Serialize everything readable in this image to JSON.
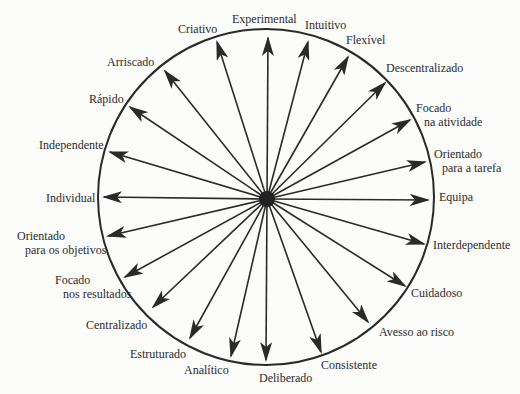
{
  "diagram": {
    "center": {
      "x": 267,
      "y": 199
    },
    "circle": {
      "cx": 266,
      "cy": 197,
      "r": 168
    },
    "colors": {
      "line": "#2a2a2a",
      "background": "#fcfcfa"
    },
    "spokes": [
      {
        "id": "experimental",
        "lines": [
          "Experimental"
        ],
        "tip": [
          268,
          38
        ],
        "label_pos": [
          232,
          12
        ]
      },
      {
        "id": "intuitivo",
        "lines": [
          "Intuitivo"
        ],
        "tip": [
          308,
          42
        ],
        "label_pos": [
          305,
          18
        ]
      },
      {
        "id": "flexivel",
        "lines": [
          "Flexível"
        ],
        "tip": [
          348,
          57
        ],
        "label_pos": [
          346,
          33
        ]
      },
      {
        "id": "descentralizado",
        "lines": [
          "Descentralizado"
        ],
        "tip": [
          385,
          83
        ],
        "label_pos": [
          386,
          61
        ]
      },
      {
        "id": "focado-na-atividade",
        "lines": [
          "Focado",
          "na atividade"
        ],
        "tip": [
          410,
          120
        ],
        "label_pos": [
          416,
          101
        ]
      },
      {
        "id": "orientado-para-a-tarefa",
        "lines": [
          "Orientado",
          "para a tarefa"
        ],
        "tip": [
          425,
          162
        ],
        "label_pos": [
          434,
          147
        ]
      },
      {
        "id": "equipa",
        "lines": [
          "Equipa"
        ],
        "tip": [
          428,
          200
        ],
        "label_pos": [
          439,
          190
        ]
      },
      {
        "id": "interdependente",
        "lines": [
          "Interdependente"
        ],
        "tip": [
          424,
          244
        ],
        "label_pos": [
          433,
          238
        ]
      },
      {
        "id": "cuidadoso",
        "lines": [
          "Cuidadoso"
        ],
        "tip": [
          405,
          286
        ],
        "label_pos": [
          411,
          286
        ]
      },
      {
        "id": "avesso-ao-risco",
        "lines": [
          "Avesso ao risco"
        ],
        "tip": [
          368,
          322
        ],
        "label_pos": [
          379,
          325
        ]
      },
      {
        "id": "consistente",
        "lines": [
          "Consistente"
        ],
        "tip": [
          321,
          352
        ],
        "label_pos": [
          321,
          358
        ]
      },
      {
        "id": "deliberado",
        "lines": [
          "Deliberado"
        ],
        "tip": [
          266,
          360
        ],
        "label_pos": [
          259,
          371
        ]
      },
      {
        "id": "analitico",
        "lines": [
          "Analítico"
        ],
        "tip": [
          231,
          356
        ],
        "label_pos": [
          184,
          363
        ]
      },
      {
        "id": "estruturado",
        "lines": [
          "Estruturado"
        ],
        "tip": [
          190,
          338
        ],
        "label_pos": [
          130,
          347
        ]
      },
      {
        "id": "centralizado",
        "lines": [
          "Centralizado"
        ],
        "tip": [
          153,
          307
        ],
        "label_pos": [
          86,
          318
        ]
      },
      {
        "id": "focado-nos-resultados",
        "lines": [
          "Focado",
          "nos resultados"
        ],
        "tip": [
          125,
          277
        ],
        "label_pos": [
          55,
          273
        ]
      },
      {
        "id": "orientado-para-os-objetivos",
        "lines": [
          "Orientado",
          "para os objetivos"
        ],
        "tip": [
          108,
          236
        ],
        "label_pos": [
          17,
          229
        ]
      },
      {
        "id": "individual",
        "lines": [
          "Individual"
        ],
        "tip": [
          104,
          197
        ],
        "label_pos": [
          46,
          191
        ]
      },
      {
        "id": "independente",
        "lines": [
          "Independente"
        ],
        "tip": [
          110,
          152
        ],
        "label_pos": [
          39,
          138
        ]
      },
      {
        "id": "rapido",
        "lines": [
          "Rápido"
        ],
        "tip": [
          130,
          107
        ],
        "label_pos": [
          89,
          92
        ]
      },
      {
        "id": "arriscado",
        "lines": [
          "Arriscado"
        ],
        "tip": [
          165,
          71
        ],
        "label_pos": [
          107,
          55
        ]
      },
      {
        "id": "criativo",
        "lines": [
          "Criativo"
        ],
        "tip": [
          217,
          42
        ],
        "label_pos": [
          178,
          22
        ]
      }
    ]
  }
}
